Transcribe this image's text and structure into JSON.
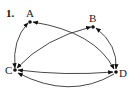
{
  "problem_number": "1.",
  "graph": {
    "type": "directed",
    "nodes": [
      {
        "id": "A",
        "label": "A"
      },
      {
        "id": "B",
        "label": "B"
      },
      {
        "id": "C",
        "label": "C"
      },
      {
        "id": "D",
        "label": "D"
      }
    ],
    "edges": [
      {
        "from": "A",
        "to": "C",
        "bidirectional": true
      },
      {
        "from": "A",
        "to": "D",
        "bidirectional": true
      },
      {
        "from": "B",
        "to": "C",
        "bidirectional": true
      },
      {
        "from": "B",
        "to": "D",
        "bidirectional": true
      },
      {
        "from": "C",
        "to": "D",
        "bidirectional": true
      },
      {
        "from": "D",
        "to": "C",
        "bidirectional": false
      }
    ]
  },
  "colors": {
    "ink": "#222222",
    "background": "#ffffff"
  }
}
